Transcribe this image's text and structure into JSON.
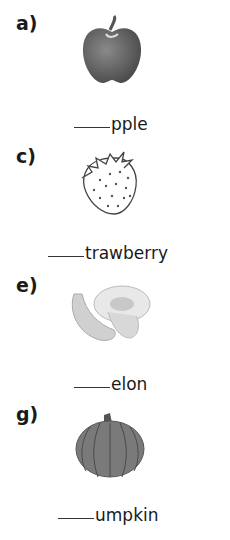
{
  "worksheet": {
    "items": [
      {
        "label": "a)",
        "picture": "apple-icon",
        "blank": "____",
        "word_ending": "pple"
      },
      {
        "label": "c)",
        "picture": "strawberry-icon",
        "blank": "____",
        "word_ending": "trawberry"
      },
      {
        "label": "e)",
        "picture": "melon-icon",
        "blank": "____",
        "word_ending": "elon"
      },
      {
        "label": "g)",
        "picture": "pumpkin-icon",
        "blank": "____",
        "word_ending": "umpkin"
      }
    ]
  }
}
